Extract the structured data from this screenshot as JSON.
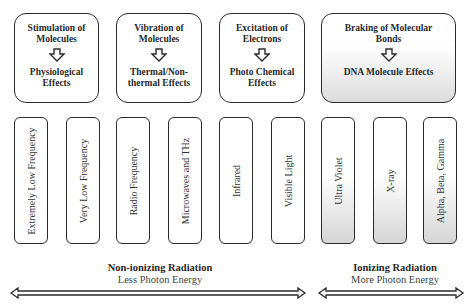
{
  "effects": [
    {
      "cause": "Stimulation of Molecules",
      "effect": "Physiological Effects"
    },
    {
      "cause": "Vibration of Molecules",
      "effect": "Thermal/Non-thermal Effects"
    },
    {
      "cause": "Excitation of Electrons",
      "effect": "Photo Chemical Effects"
    },
    {
      "cause": "Braking of Molecular Bonds",
      "effect": "DNA Molecule Effects"
    }
  ],
  "spectrum": [
    {
      "label": "Extremely Low Frequency",
      "ionizing": false
    },
    {
      "label": "Very Low Frequency",
      "ionizing": false
    },
    {
      "label": "Radio Frequency",
      "ionizing": false
    },
    {
      "label": "Microwaves and THz",
      "ionizing": false
    },
    {
      "label": "Infrared",
      "ionizing": false
    },
    {
      "label": "Visible Light",
      "ionizing": false
    },
    {
      "label": "Ultra Violet",
      "ionizing": true
    },
    {
      "label": "X-ray",
      "ionizing": true
    },
    {
      "label": "Alpha, Beta, Gamma",
      "ionizing": true
    }
  ],
  "regions": {
    "non_ionizing": {
      "title": "Non-ionizing Radiation",
      "subtitle": "Less Photon Energy"
    },
    "ionizing": {
      "title": "Ionizing Radiation",
      "subtitle": "More Photon Energy"
    }
  },
  "colors": {
    "border": "#2b2b2b",
    "gradient_end": "#d5d5d5"
  }
}
